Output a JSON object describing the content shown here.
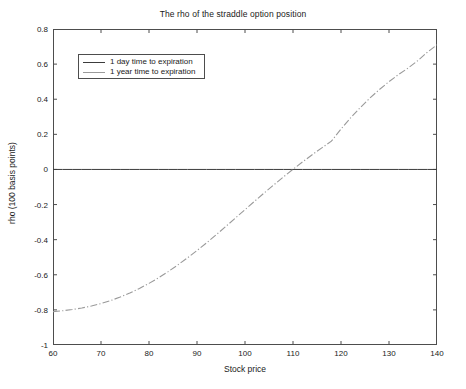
{
  "chart_data": {
    "type": "line",
    "title": "The rho of the straddle option position",
    "xlabel": "Stock price",
    "ylabel": "rho (100 basis points)",
    "xlim": [
      60,
      140
    ],
    "ylim": [
      -1,
      0.8
    ],
    "xticks": [
      60,
      70,
      80,
      90,
      100,
      110,
      120,
      130,
      140
    ],
    "xtick_labels": [
      "60",
      "70",
      "80",
      "90",
      "100",
      "110",
      "120",
      "130",
      "140"
    ],
    "yticks": [
      -1,
      -0.8,
      -0.6,
      -0.4,
      -0.2,
      0,
      0.2,
      0.4,
      0.6,
      0.8
    ],
    "ytick_labels": [
      "-1",
      "-0.8",
      "-0.6",
      "-0.4",
      "-0.2",
      "0",
      "0.2",
      "0.4",
      "0.6",
      "0.8"
    ],
    "grid": false,
    "legend_position": "upper left",
    "x": [
      60,
      62,
      64,
      66,
      68,
      70,
      72,
      74,
      76,
      78,
      80,
      82,
      84,
      86,
      88,
      90,
      92,
      94,
      96,
      98,
      100,
      102,
      104,
      106,
      108,
      110,
      112,
      114,
      116,
      118,
      120,
      122,
      124,
      126,
      128,
      130,
      132,
      134,
      136,
      138,
      140
    ],
    "series": [
      {
        "name": "1 day time to expiration",
        "color": "#3c3c3c",
        "style": "solid",
        "values": [
          0,
          0,
          0,
          0,
          0,
          0,
          0,
          0,
          0,
          0,
          0,
          0,
          0,
          0,
          0,
          0,
          0,
          0,
          0,
          0,
          0,
          0,
          0,
          0,
          0,
          0,
          0,
          0,
          0,
          0,
          0,
          0,
          0,
          0,
          0,
          0,
          0,
          0,
          0,
          0,
          0
        ]
      },
      {
        "name": "1 year time to expiration",
        "color": "#9a9a9a",
        "style": "dashdot",
        "values": [
          -0.81,
          -0.805,
          -0.798,
          -0.789,
          -0.778,
          -0.764,
          -0.747,
          -0.727,
          -0.704,
          -0.678,
          -0.649,
          -0.617,
          -0.582,
          -0.544,
          -0.504,
          -0.462,
          -0.418,
          -0.372,
          -0.325,
          -0.277,
          -0.229,
          -0.181,
          -0.134,
          -0.088,
          -0.043,
          0.001,
          0.043,
          0.084,
          0.123,
          0.161,
          0.23,
          0.294,
          0.352,
          0.406,
          0.455,
          0.5,
          0.541,
          0.578,
          0.62,
          0.668,
          0.71
        ]
      }
    ],
    "zero_crossing_1_year": 97.3,
    "legend": [
      {
        "label": "1 day time to expiration"
      },
      {
        "label": "1 year time to expiration"
      }
    ]
  }
}
